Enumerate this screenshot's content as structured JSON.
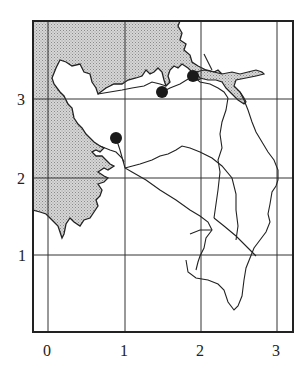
{
  "map": {
    "x_axis": {
      "ticks": [
        "0",
        "1",
        "2",
        "3"
      ]
    },
    "y_axis": {
      "ticks": [
        "1",
        "2",
        "3"
      ]
    },
    "colors": {
      "frame": "#222222",
      "grid": "#333333",
      "land_hatch": "#bdbdbd",
      "coast": "#222222",
      "marker": "#1a1a1a"
    },
    "markers": [
      {
        "label": "site-a",
        "x": 0.88,
        "y": 2.52
      },
      {
        "label": "site-b",
        "x": 1.49,
        "y": 3.09
      },
      {
        "label": "site-c",
        "x": 1.89,
        "y": 3.29
      }
    ]
  }
}
